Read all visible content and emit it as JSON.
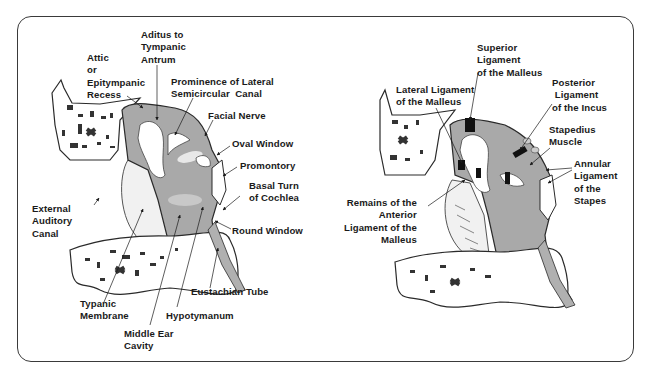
{
  "figure": {
    "left_panel": {
      "title": "Middle ear anatomy - cross section",
      "labels": {
        "aditus": "Aditus to\nTympanic\nAntrum",
        "attic": "Attic\nor\nEpitympanic\nRecess",
        "prominence": "Prominence of Lateral\nSemicircular  Canal",
        "facial_nerve": "Facial Nerve",
        "oval_window": "Oval Window",
        "promontory": "Promontory",
        "basal_turn": "Basal Turn\nof Cochlea",
        "external_canal": "External\nAuditory\nCanal",
        "round_window": "Round Window",
        "eustachian": "Eustachian Tube",
        "tympanic_membrane": "Typanic\nMembrane",
        "hypotympanum": "Hypotymanum",
        "middle_ear_cavity": "Middle Ear\nCavity"
      }
    },
    "right_panel": {
      "title": "Middle ear ligaments",
      "labels": {
        "superior_ligament": "Superior\nLigament\nof the Malleus",
        "lateral_ligament": "Lateral Ligament\nof the Malleus",
        "posterior_ligament": "Posterior\n Ligament\nof the Incus",
        "stapedius": "Stapedius\nMuscle",
        "annular_ligament": "Annular\nLigament\nof the\nStapes",
        "anterior_ligament": "Remains of the\nAnterior\nLigament of the\nMalleus"
      }
    },
    "colors": {
      "cavity_fill": "#a9a9a9",
      "cavity_light": "#cfcfcf",
      "bone_fill": "#ffffff",
      "outline": "#2a2a2a",
      "ligament": "#111111",
      "membrane_fill": "#f2f2f2"
    }
  }
}
